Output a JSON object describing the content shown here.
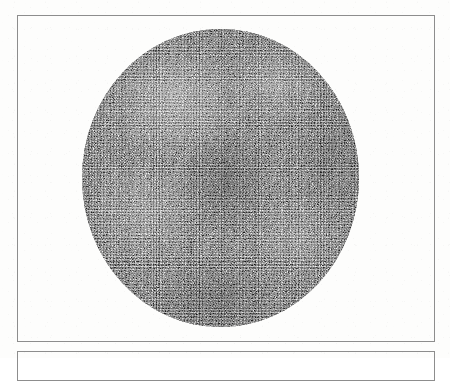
{
  "page": {
    "background_color": "#fdfdfc",
    "width": 450,
    "height": 358,
    "caption": "",
    "alt_description": "Halftone-printed circular micrograph plate"
  },
  "frames": [
    {
      "name": "primary-plate-frame",
      "border_color": "#8d8d8d",
      "border_width_px": 1,
      "x": 17,
      "y": 15,
      "width": 418,
      "height": 327,
      "label": ""
    },
    {
      "name": "secondary-plate-frame",
      "border_color": "#8d8d8d",
      "border_width_px": 1,
      "x": 17,
      "y": 351,
      "width": 418,
      "height": 30,
      "label": ""
    }
  ],
  "figure": {
    "shape": "circle",
    "name": "circular-specimen",
    "center_x": 220,
    "center_y": 178,
    "width": 277,
    "height": 298,
    "fill_description": "dense gray engraved stipple texture",
    "base_color": "#8f8f8e",
    "ink_dark": "#141414",
    "ink_light": "#ffffff",
    "label": ""
  }
}
